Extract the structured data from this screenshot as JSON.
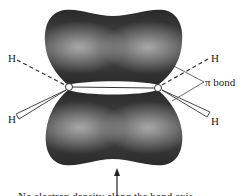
{
  "diagram": {
    "type": "pi-bond orbital diagram (ethylene)",
    "labels": {
      "h_top_left": "H",
      "h_bottom_left": "H",
      "h_top_right": "H",
      "h_bottom_right": "H",
      "pi_bond": "π bond",
      "caption_partial": "No electron density along the bond axis"
    },
    "colors": {
      "lobe_dark": "#2b2b2b",
      "lobe_highlight": "#9a9a9a",
      "line": "#333333",
      "background": "#ffffff"
    }
  }
}
